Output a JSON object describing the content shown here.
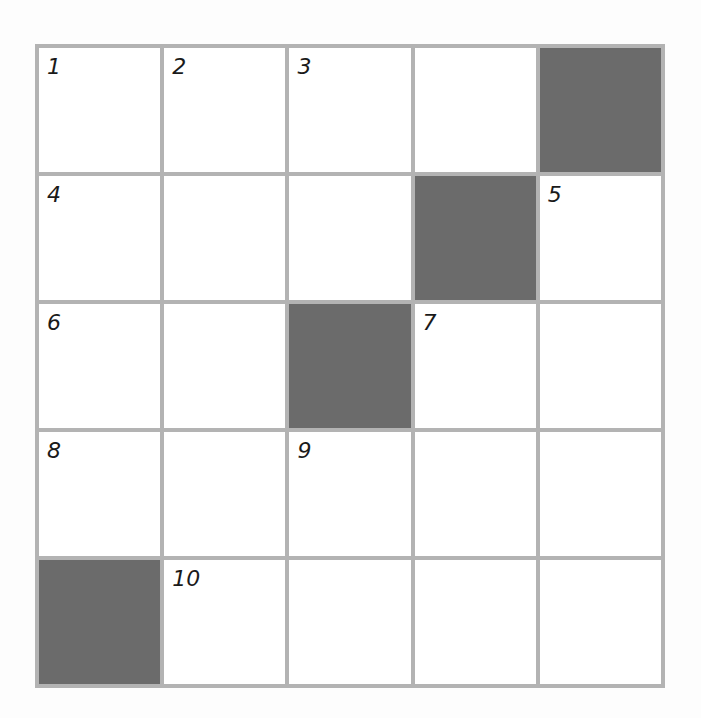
{
  "puzzle": {
    "type": "crossword",
    "rows": 5,
    "cols": 5,
    "colors": {
      "grid_line": "#b3b3b3",
      "block": "#6b6b6b",
      "cell": "#ffffff",
      "number": "#1a1a1a"
    },
    "cells": [
      [
        {
          "n": "1"
        },
        {
          "n": "2"
        },
        {
          "n": "3"
        },
        {
          "n": ""
        },
        {
          "block": true
        }
      ],
      [
        {
          "n": "4"
        },
        {
          "n": ""
        },
        {
          "n": ""
        },
        {
          "block": true
        },
        {
          "n": "5"
        }
      ],
      [
        {
          "n": "6"
        },
        {
          "n": ""
        },
        {
          "block": true
        },
        {
          "n": "7"
        },
        {
          "n": ""
        }
      ],
      [
        {
          "n": "8"
        },
        {
          "n": ""
        },
        {
          "n": "9"
        },
        {
          "n": ""
        },
        {
          "n": ""
        }
      ],
      [
        {
          "block": true
        },
        {
          "n": "10"
        },
        {
          "n": ""
        },
        {
          "n": ""
        },
        {
          "n": ""
        }
      ]
    ]
  }
}
